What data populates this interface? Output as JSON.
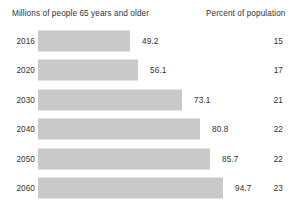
{
  "header": {
    "millions_label": "Millions of people 65 years and older",
    "percent_label": "Percent of population"
  },
  "chart_data": {
    "type": "bar",
    "title": "",
    "xlabel": "Millions of people 65 years and older",
    "ylabel": "",
    "orientation": "horizontal",
    "grid": false,
    "legend": "none",
    "categories": [
      "2016",
      "2020",
      "2030",
      "2040",
      "2050",
      "2060"
    ],
    "values": [
      49.2,
      56.1,
      73.1,
      80.8,
      85.7,
      94.7
    ],
    "value_labels": [
      "49.2",
      "56.1",
      "73.1",
      "80.8",
      "85.7",
      "94.7"
    ],
    "xlim": [
      0,
      94.7
    ],
    "series": [
      {
        "name": "Millions of people 65 years and older",
        "values": [
          49.2,
          56.1,
          73.1,
          80.8,
          85.7,
          94.7
        ]
      },
      {
        "name": "Percent of population",
        "values": [
          15,
          17,
          21,
          22,
          22,
          23
        ],
        "value_labels": [
          "15",
          "17",
          "21",
          "22",
          "22",
          "23"
        ]
      }
    ],
    "rows": [
      {
        "year": "2016",
        "millions": "49.2",
        "percent": "15",
        "bar_px": 92
      },
      {
        "year": "2020",
        "millions": "56.1",
        "percent": "17",
        "bar_px": 100
      },
      {
        "year": "2030",
        "millions": "73.1",
        "percent": "21",
        "bar_px": 144
      },
      {
        "year": "2040",
        "millions": "80.8",
        "percent": "22",
        "bar_px": 162
      },
      {
        "year": "2050",
        "millions": "85.7",
        "percent": "22",
        "bar_px": 172
      },
      {
        "year": "2060",
        "millions": "94.7",
        "percent": "23",
        "bar_px": 185
      }
    ],
    "colors": {
      "bar_fill": "#c9c9c9",
      "text": "#333333",
      "background": "#ffffff"
    }
  }
}
